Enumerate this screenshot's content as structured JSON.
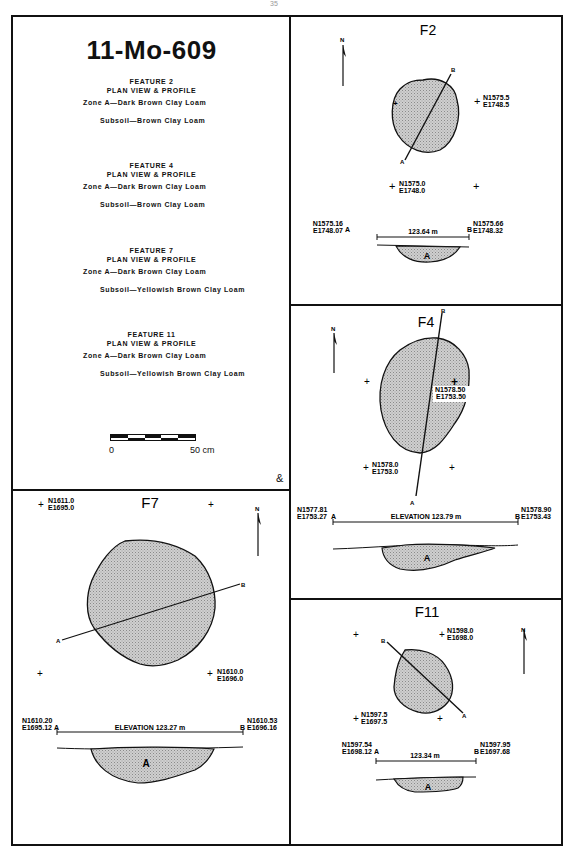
{
  "page_number": "35",
  "legend": {
    "site_title": "11-Mo-609",
    "features": [
      {
        "heading": "FEATURE 2",
        "subheading": "PLAN VIEW & PROFILE",
        "zone": "Zone A—Dark Brown Clay Loam",
        "subsoil": "Subsoil—Brown Clay Loam"
      },
      {
        "heading": "FEATURE 4",
        "subheading": "PLAN VIEW & PROFILE",
        "zone": "Zone A—Dark Brown Clay Loam",
        "subsoil": "Subsoil—Brown Clay Loam"
      },
      {
        "heading": "FEATURE 7",
        "subheading": "PLAN VIEW & PROFILE",
        "zone": "Zone A—Dark Brown Clay Loam",
        "subsoil": "Subsoil—Yellowish Brown Clay Loam"
      },
      {
        "heading": "FEATURE 11",
        "subheading": "PLAN VIEW & PROFILE",
        "zone": "Zone A—Dark Brown Clay Loam",
        "subsoil": "Subsoil—Yellowish Brown Clay Loam"
      }
    ],
    "scale": {
      "start_label": "0",
      "end_label": "50 cm"
    },
    "monogram": "&"
  },
  "panels": {
    "f2": {
      "title": "F2",
      "north": "N",
      "datums": [
        {
          "n": "N1575.5",
          "e": "E1748.5"
        },
        {
          "n": "N1575.0",
          "e": "E1748.0"
        }
      ],
      "section": {
        "a": "A",
        "b": "B"
      },
      "profile": {
        "a_n": "N1575.16",
        "a_e": "E1748.07",
        "a": "A",
        "b_n": "N1575.66",
        "b_e": "E1748.32",
        "b": "B",
        "elevation": "123.64  m",
        "zone": "A"
      }
    },
    "f4": {
      "title": "F4",
      "north": "N",
      "datums": [
        {
          "n": "N1578.50",
          "e": "E1753.50"
        },
        {
          "n": "N1578.0",
          "e": "E1753.0"
        }
      ],
      "section": {
        "a": "A",
        "b": "B"
      },
      "profile": {
        "a_n": "N1577.81",
        "a_e": "E1753.27",
        "a": "A",
        "b_n": "N1578.90",
        "b_e": "E1753.43",
        "b": "B",
        "elevation": "ELEVATION   123.79  m",
        "zone": "A"
      }
    },
    "f7": {
      "title": "F7",
      "north": "N",
      "datums": [
        {
          "n": "N1611.0",
          "e": "E1695.0"
        },
        {
          "n": "N1610.0",
          "e": "E1696.0"
        }
      ],
      "section": {
        "a": "A",
        "b": "B"
      },
      "profile": {
        "a_n": "N1610.20",
        "a_e": "E1695.12",
        "a": "A",
        "b_n": "N1610.53",
        "b_e": "E1696.16",
        "b": "B",
        "elevation": "ELEVATION   123.27  m",
        "zone": "A"
      }
    },
    "f11": {
      "title": "F11",
      "north": "N",
      "datums": [
        {
          "n": "N1598.0",
          "e": "E1698.0"
        },
        {
          "n": "N1597.5",
          "e": "E1697.5"
        }
      ],
      "section": {
        "a": "A",
        "b": "B"
      },
      "profile": {
        "a_n": "N1597.54",
        "a_e": "E1698.12",
        "a": "A",
        "b_n": "N1597.95",
        "b_e": "E1697.68",
        "b": "B",
        "elevation": "123.34  m",
        "zone": "A"
      }
    }
  },
  "colors": {
    "ink": "#111111",
    "fill": "#c8c8c8",
    "paper": "#ffffff"
  }
}
